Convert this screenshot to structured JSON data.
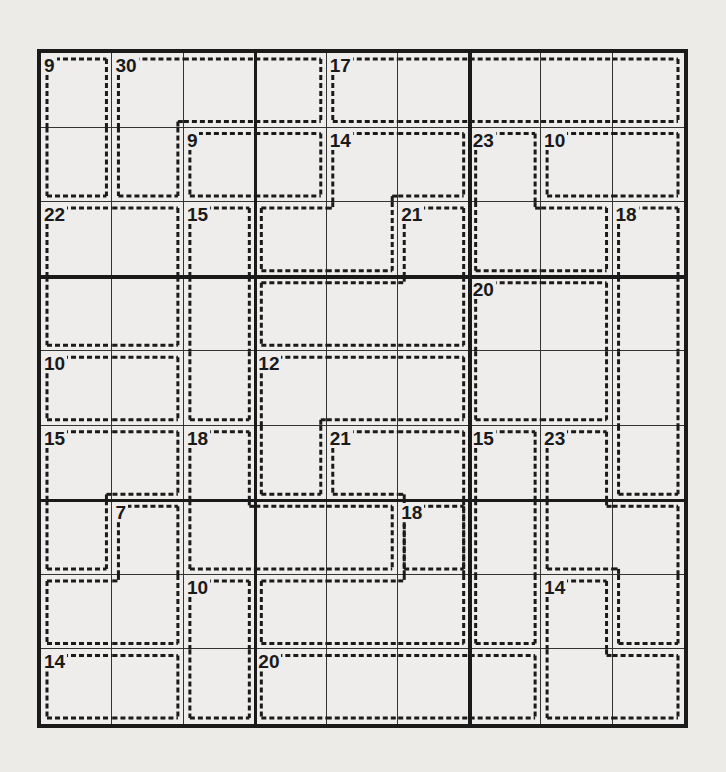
{
  "puzzle": {
    "type": "killer-sudoku",
    "size": 9,
    "cages": [
      {
        "sum": 9,
        "cells": [
          [
            0,
            0
          ],
          [
            1,
            0
          ]
        ]
      },
      {
        "sum": 30,
        "cells": [
          [
            0,
            1
          ],
          [
            1,
            1
          ],
          [
            0,
            2
          ],
          [
            0,
            3
          ]
        ]
      },
      {
        "sum": 17,
        "cells": [
          [
            0,
            4
          ],
          [
            0,
            5
          ],
          [
            0,
            6
          ],
          [
            0,
            7
          ],
          [
            0,
            8
          ]
        ]
      },
      {
        "sum": 9,
        "cells": [
          [
            1,
            2
          ],
          [
            1,
            3
          ]
        ]
      },
      {
        "sum": 14,
        "cells": [
          [
            1,
            4
          ],
          [
            1,
            5
          ],
          [
            2,
            3
          ],
          [
            2,
            4
          ]
        ]
      },
      {
        "sum": 23,
        "cells": [
          [
            1,
            6
          ],
          [
            2,
            6
          ],
          [
            2,
            7
          ]
        ]
      },
      {
        "sum": 10,
        "cells": [
          [
            1,
            7
          ],
          [
            1,
            8
          ]
        ]
      },
      {
        "sum": 22,
        "cells": [
          [
            2,
            0
          ],
          [
            2,
            1
          ],
          [
            3,
            0
          ],
          [
            3,
            1
          ]
        ]
      },
      {
        "sum": 15,
        "cells": [
          [
            2,
            2
          ],
          [
            3,
            2
          ],
          [
            4,
            2
          ]
        ]
      },
      {
        "sum": 21,
        "cells": [
          [
            2,
            5
          ],
          [
            3,
            3
          ],
          [
            3,
            4
          ],
          [
            3,
            5
          ]
        ]
      },
      {
        "sum": 18,
        "cells": [
          [
            2,
            8
          ],
          [
            3,
            8
          ],
          [
            4,
            8
          ],
          [
            5,
            8
          ]
        ]
      },
      {
        "sum": 20,
        "cells": [
          [
            3,
            6
          ],
          [
            3,
            7
          ],
          [
            4,
            6
          ],
          [
            4,
            7
          ]
        ]
      },
      {
        "sum": 10,
        "cells": [
          [
            4,
            0
          ],
          [
            4,
            1
          ]
        ]
      },
      {
        "sum": 12,
        "cells": [
          [
            4,
            3
          ],
          [
            4,
            4
          ],
          [
            4,
            5
          ],
          [
            5,
            3
          ]
        ]
      },
      {
        "sum": 15,
        "cells": [
          [
            5,
            0
          ],
          [
            5,
            1
          ],
          [
            6,
            0
          ]
        ]
      },
      {
        "sum": 18,
        "cells": [
          [
            5,
            2
          ],
          [
            6,
            2
          ],
          [
            6,
            3
          ],
          [
            6,
            4
          ]
        ]
      },
      {
        "sum": 21,
        "cells": [
          [
            5,
            4
          ],
          [
            5,
            5
          ],
          [
            6,
            5
          ]
        ]
      },
      {
        "sum": 15,
        "cells": [
          [
            5,
            6
          ],
          [
            6,
            6
          ],
          [
            7,
            6
          ]
        ]
      },
      {
        "sum": 23,
        "cells": [
          [
            5,
            7
          ],
          [
            6,
            7
          ],
          [
            6,
            8
          ],
          [
            7,
            8
          ]
        ]
      },
      {
        "sum": 7,
        "cells": [
          [
            6,
            1
          ],
          [
            7,
            0
          ],
          [
            7,
            1
          ]
        ]
      },
      {
        "sum": 18,
        "cells": [
          [
            6,
            5
          ],
          [
            7,
            3
          ],
          [
            7,
            4
          ],
          [
            7,
            5
          ]
        ]
      },
      {
        "sum": 10,
        "cells": [
          [
            7,
            2
          ],
          [
            8,
            2
          ]
        ]
      },
      {
        "sum": 14,
        "cells": [
          [
            7,
            7
          ],
          [
            8,
            7
          ],
          [
            8,
            8
          ]
        ]
      },
      {
        "sum": 14,
        "cells": [
          [
            8,
            0
          ],
          [
            8,
            1
          ]
        ]
      },
      {
        "sum": 20,
        "cells": [
          [
            8,
            3
          ],
          [
            8,
            4
          ],
          [
            8,
            5
          ],
          [
            8,
            6
          ]
        ]
      }
    ],
    "givens": []
  }
}
